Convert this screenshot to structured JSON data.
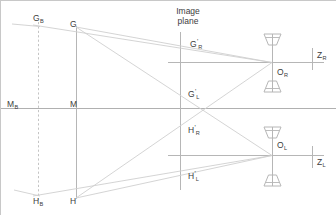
{
  "figure": {
    "title_line1": "Image",
    "title_line2": "plane",
    "background": "#ffffff",
    "line_color": "#b9b9b9",
    "strong_line_color": "#a8a8a8",
    "text_color": "#3c3c3c",
    "width": 336,
    "height": 215
  },
  "labels": {
    "g_b": {
      "base": "G",
      "sub": "B",
      "sup": "",
      "x": 33,
      "y": 14
    },
    "g": {
      "base": "G",
      "sub": "",
      "sup": "",
      "x": 70,
      "y": 20
    },
    "m_b": {
      "base": "M",
      "sub": "B",
      "sup": "",
      "x": 7,
      "y": 100
    },
    "m": {
      "base": "M",
      "sub": "",
      "sup": "",
      "x": 70,
      "y": 100
    },
    "h_b": {
      "base": "H",
      "sub": "B",
      "sup": "",
      "x": 33,
      "y": 197
    },
    "h": {
      "base": "H",
      "sub": "",
      "sup": "",
      "x": 70,
      "y": 197
    },
    "g_r_prime": {
      "base": "G",
      "sub": "R",
      "sup": "'",
      "x": 190,
      "y": 40
    },
    "g_l_prime": {
      "base": "G",
      "sub": "L",
      "sup": "'",
      "x": 188,
      "y": 90
    },
    "h_r_prime": {
      "base": "H",
      "sub": "R",
      "sup": "'",
      "x": 188,
      "y": 126
    },
    "h_l_prime": {
      "base": "H",
      "sub": "L",
      "sup": "'",
      "x": 188,
      "y": 172
    },
    "o_r": {
      "base": "O",
      "sub": "R",
      "sup": "",
      "x": 277,
      "y": 68
    },
    "o_l": {
      "base": "O",
      "sub": "L",
      "sup": "",
      "x": 277,
      "y": 141
    },
    "z_r": {
      "base": "Z",
      "sub": "R",
      "sup": "",
      "x": 317,
      "y": 51
    },
    "z_l": {
      "base": "Z",
      "sub": "L",
      "sup": "",
      "x": 317,
      "y": 158
    }
  },
  "geometry": {
    "vertical_dashed_x": 38,
    "vertical_solid_x": 76,
    "image_plane_x": 180,
    "camera_right_x": 272,
    "camera_left_x": 272,
    "main_horizontal_y": 108,
    "right_axis_y": 62,
    "left_axis_y": 155
  },
  "icons": {
    "camera_right_top": "camera-cone-icon",
    "camera_right_bottom": "camera-cone-icon",
    "camera_left_top": "camera-cone-icon",
    "camera_left_bottom": "camera-cone-icon"
  }
}
